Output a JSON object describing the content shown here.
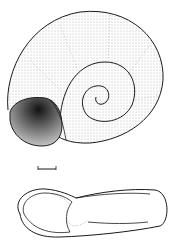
{
  "figure": {
    "views": [
      {
        "name": "apical view",
        "position": "top"
      },
      {
        "name": "lateral view",
        "position": "bottom"
      }
    ],
    "scale_bar": {
      "visible": true,
      "label": ""
    },
    "colors": {
      "ink": "#1a1a1a",
      "background": "#ffffff",
      "stipple": "#555555"
    }
  }
}
